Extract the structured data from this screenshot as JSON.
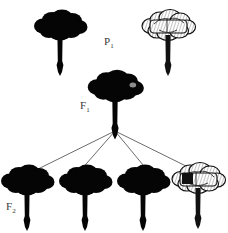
{
  "diagram": {
    "kind": "monohybrid-cross-inheritance-diagram",
    "background_color": "#ffffff",
    "ink_color": "#000000",
    "width": 228,
    "height": 233,
    "generations": [
      {
        "id": "P1",
        "label_text": "P",
        "label_subscript": "1",
        "label_x": 104,
        "label_y": 36,
        "organisms": [
          {
            "id": "p1-parent-left",
            "name": "black-flower",
            "phenotype": "black",
            "fill": "#000000",
            "cx": 60,
            "head_cy": 25,
            "scale": 1.0
          },
          {
            "id": "p1-parent-right",
            "name": "white-flower",
            "phenotype": "white",
            "fill": "#ffffff",
            "cx": 168,
            "head_cy": 25,
            "scale": 1.0
          }
        ]
      },
      {
        "id": "F1",
        "label_text": "F",
        "label_subscript": "1",
        "label_x": 80,
        "label_y": 100,
        "organisms": [
          {
            "id": "f1-offspring",
            "name": "black-flower",
            "phenotype": "black",
            "fill": "#000000",
            "cx": 115,
            "head_cy": 86,
            "scale": 1.05
          }
        ]
      },
      {
        "id": "F2",
        "label_text": "F",
        "label_subscript": "2",
        "label_x": 6,
        "label_y": 201,
        "organisms": [
          {
            "id": "f2-offspring-1",
            "name": "black-flower",
            "phenotype": "black",
            "fill": "#000000",
            "cx": 27,
            "head_cy": 180,
            "scale": 1.0
          },
          {
            "id": "f2-offspring-2",
            "name": "black-flower",
            "phenotype": "black",
            "fill": "#000000",
            "cx": 85,
            "head_cy": 180,
            "scale": 1.0
          },
          {
            "id": "f2-offspring-3",
            "name": "black-flower",
            "phenotype": "black",
            "fill": "#000000",
            "cx": 143,
            "head_cy": 180,
            "scale": 1.0
          },
          {
            "id": "f2-offspring-4",
            "name": "white-flower",
            "phenotype": "white",
            "fill": "#ffffff",
            "cx": 198,
            "head_cy": 178,
            "scale": 1.0
          }
        ]
      }
    ],
    "descent_lines": {
      "origin_x": 115,
      "origin_y": 131,
      "stroke": "#2b2b2b",
      "stroke_width": 0.7,
      "targets": [
        {
          "id": "line-to-f2-1",
          "x": 32,
          "y": 172
        },
        {
          "id": "line-to-f2-2",
          "x": 80,
          "y": 171
        },
        {
          "id": "line-to-f2-3",
          "x": 148,
          "y": 171
        },
        {
          "id": "line-to-f2-4",
          "x": 192,
          "y": 169
        }
      ]
    }
  }
}
